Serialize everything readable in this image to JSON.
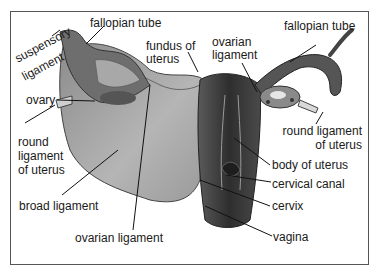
{
  "diagram": {
    "colors": {
      "border": "#555555",
      "text": "#1a1a1a",
      "leader": "#111111",
      "tissue_dark": "#3a3a3a",
      "tissue_mid": "#7a7a7a",
      "tissue_light": "#b8b8b8"
    },
    "labels": {
      "suspensory_ligament_1": "suspensory",
      "suspensory_ligament_2": "ligament",
      "fallopian_tube_left": "fallopian tube",
      "fundus_1": "fundus of",
      "fundus_2": "uterus",
      "ovarian_ligament_top_1": "ovarian",
      "ovarian_ligament_top_2": "ligament",
      "fallopian_tube_right": "fallopian tube",
      "ovary": "ovary",
      "round_ligament_left_1": "round",
      "round_ligament_left_2": "ligament",
      "round_ligament_left_3": "of uterus",
      "round_ligament_right_1": "round ligament",
      "round_ligament_right_2": "of uterus",
      "body_of_uterus": "body of uterus",
      "cervical_canal": "cervical canal",
      "cervix": "cervix",
      "broad_ligament": "broad ligament",
      "ovarian_ligament_bottom": "ovarian ligament",
      "vagina": "vagina"
    }
  }
}
